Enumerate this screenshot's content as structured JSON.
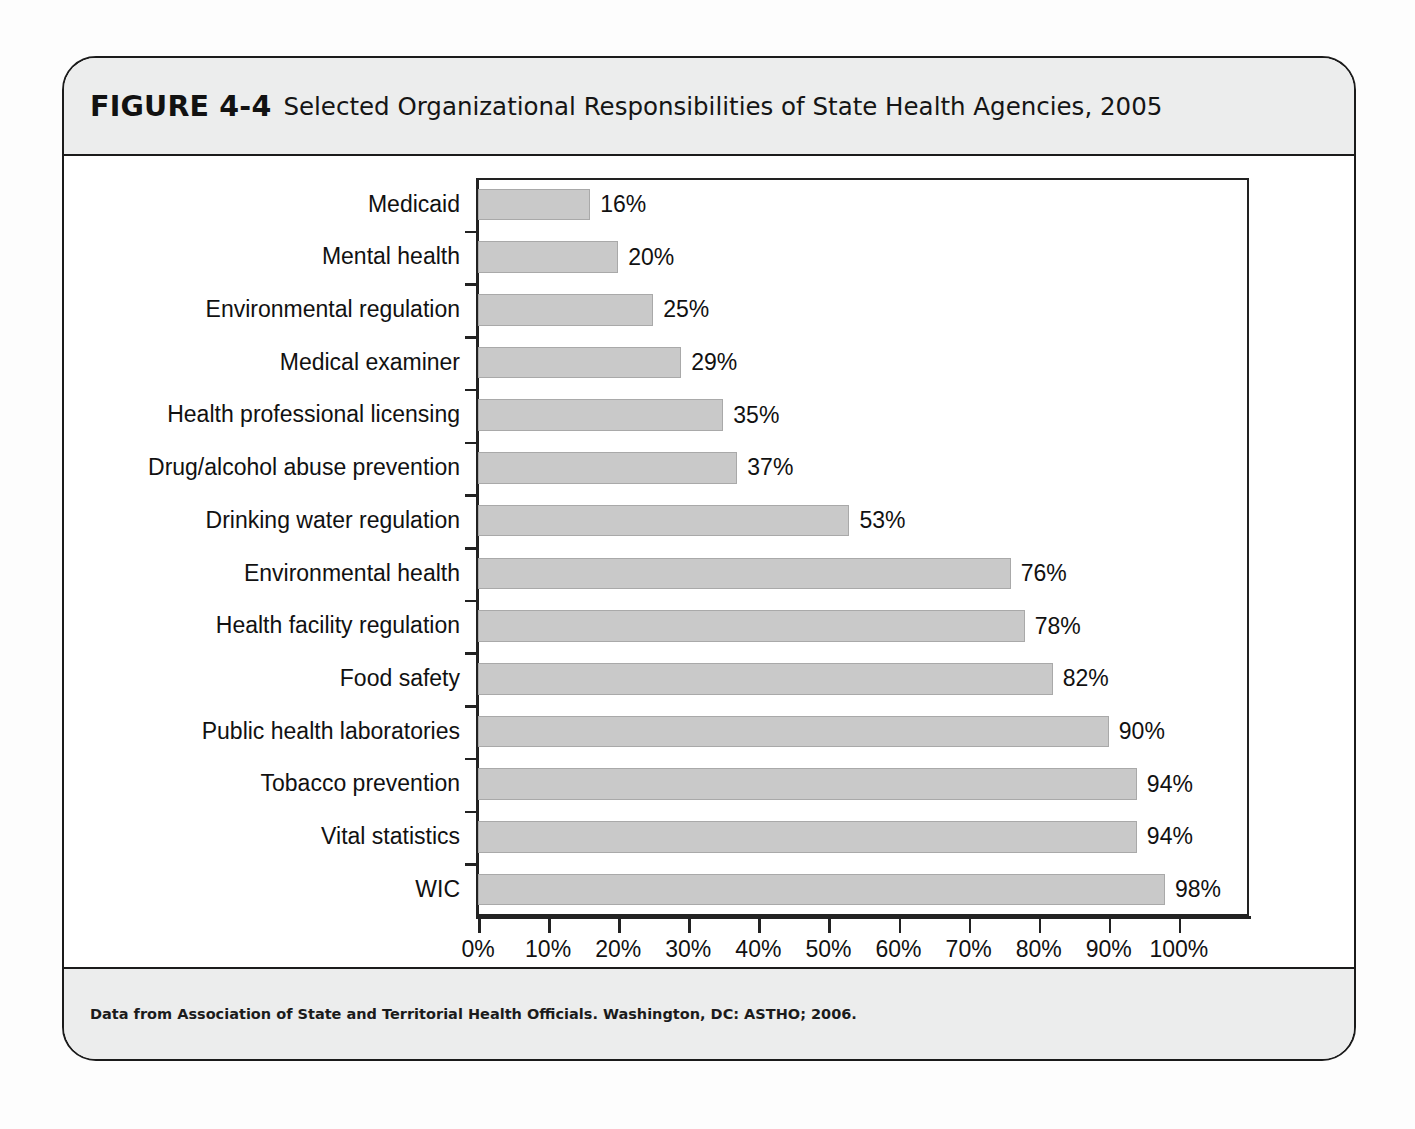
{
  "figure": {
    "label": "FIGURE 4-4",
    "title": "Selected Organizational Responsibilities of State Health Agencies, 2005",
    "source": "Data from Association of State and Territorial Health Officials. Washington, DC: ASTHO; 2006."
  },
  "colors": {
    "bar_fill": "#c9c9c9",
    "bar_stroke": "#a9a9a9",
    "axis": "#222222",
    "band_background": "#eceded",
    "frame": "#1b1b1b"
  },
  "chart_data": {
    "type": "bar",
    "orientation": "horizontal",
    "title": "Selected Organizational Responsibilities of State Health Agencies, 2005",
    "xlabel": "",
    "ylabel": "",
    "xlim": [
      0,
      110
    ],
    "xticks": [
      0,
      10,
      20,
      30,
      40,
      50,
      60,
      70,
      80,
      90,
      100
    ],
    "xtick_labels": [
      "0%",
      "10%",
      "20%",
      "30%",
      "40%",
      "50%",
      "60%",
      "70%",
      "80%",
      "90%",
      "100%"
    ],
    "grid": false,
    "legend": "none",
    "categories": [
      "Medicaid",
      "Mental health",
      "Environmental regulation",
      "Medical examiner",
      "Health professional licensing",
      "Drug/alcohol abuse prevention",
      "Drinking water regulation",
      "Environmental health",
      "Health facility regulation",
      "Food safety",
      "Public health laboratories",
      "Tobacco prevention",
      "Vital statistics",
      "WIC"
    ],
    "values": [
      16,
      20,
      25,
      29,
      35,
      37,
      53,
      76,
      78,
      82,
      90,
      94,
      94,
      98
    ],
    "value_labels": [
      "16%",
      "20%",
      "25%",
      "29%",
      "35%",
      "37%",
      "53%",
      "76%",
      "78%",
      "82%",
      "90%",
      "94%",
      "94%",
      "98%"
    ]
  }
}
